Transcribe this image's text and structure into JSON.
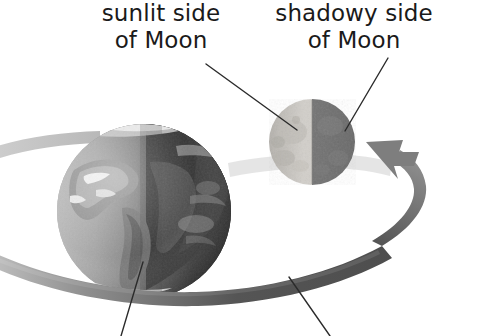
{
  "diagram": {
    "background_color": "#ffffff",
    "labels": {
      "sunlit": {
        "line1": "sunlit side",
        "line2": "of Moon"
      },
      "shadowy": {
        "line1": "shadowy side",
        "line2": "of Moon"
      }
    },
    "bodies": {
      "earth": {
        "name": "Earth",
        "center_x": 144,
        "center_y": 211,
        "radius": 87,
        "light_side": "left",
        "dark_side": "right",
        "palette": {
          "ocean_light": "#9a9a9a",
          "ocean_dark": "#2f2f2f",
          "land_light": "#d9d9d9",
          "land_mid": "#6e6e6e",
          "cloud": "#f2f2f2",
          "terminator": "#4a4a4a"
        }
      },
      "moon": {
        "name": "Moon",
        "center_x": 312,
        "center_y": 142,
        "radius": 43,
        "light_side": "left",
        "dark_side": "right",
        "palette": {
          "sunlit": "#c9c7c2",
          "shadowy": "#6f6f6f",
          "crater": "#a6a29c"
        }
      }
    },
    "orbit": {
      "name": "Moon orbit band",
      "direction": "counterclockwise-from-viewer",
      "has_arrowhead": true,
      "arrow_position": "right",
      "palette": {
        "front_dark": "#595959",
        "mid_gray": "#8a8a8a",
        "back_faded": "#c8c8c8",
        "arrow": "#7e7e7e"
      }
    },
    "leader_lines": {
      "color": "#2b2b2b",
      "width": 1.4,
      "items": [
        {
          "name": "sunlit-side-leader",
          "x1": 206,
          "y1": 64,
          "x2": 297,
          "y2": 130
        },
        {
          "name": "shadowy-side-leader",
          "x1": 388,
          "y1": 58,
          "x2": 345,
          "y2": 131
        },
        {
          "name": "earth-leader",
          "x1": 143,
          "y1": 262,
          "x2": 121,
          "y2": 336
        },
        {
          "name": "orbit-leader",
          "x1": 289,
          "y1": 277,
          "x2": 330,
          "y2": 336
        }
      ]
    }
  }
}
